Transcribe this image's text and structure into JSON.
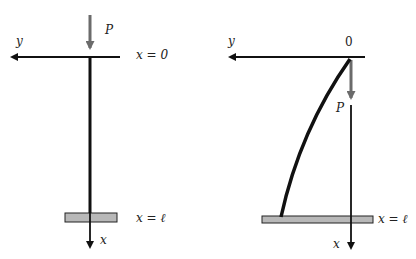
{
  "diagram": {
    "type": "column-buckling",
    "colors": {
      "line": "#111111",
      "load_arrow": "#6b6b6b",
      "plate_fill": "#b8b8b8",
      "plate_stroke": "#222222"
    },
    "left_panel": {
      "description": "Undeformed column",
      "labels": {
        "y_axis": "y",
        "x_axis": "x",
        "load": "P",
        "top": "x = 0",
        "bottom": "x = ℓ"
      }
    },
    "right_panel": {
      "description": "Deflected column",
      "labels": {
        "y_axis": "y",
        "x_axis": "x",
        "load": "P",
        "origin": "0",
        "bottom": "x = ℓ"
      }
    }
  }
}
